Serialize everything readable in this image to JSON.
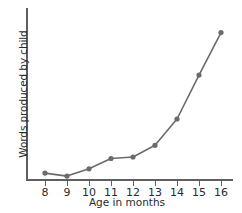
{
  "chart_data": {
    "type": "line",
    "title": "",
    "xlabel": "Age in months",
    "ylabel": "Words produced by child",
    "categories": [
      "8",
      "9",
      "10",
      "11",
      "12",
      "13",
      "14",
      "15",
      "16"
    ],
    "x": [
      8,
      9,
      10,
      11,
      12,
      13,
      14,
      15,
      16
    ],
    "values": [
      4,
      2,
      7,
      14,
      15,
      23,
      41,
      71,
      100
    ],
    "xlim": [
      8,
      16
    ],
    "ylim": [
      0,
      110
    ],
    "x_tick_labels": [
      "8",
      "9",
      "10",
      "11",
      "12",
      "13",
      "14",
      "15",
      "16"
    ],
    "y_tick_labels": [],
    "grid": false,
    "legend": false,
    "series": [
      {
        "name": "Words produced by child",
        "values": [
          4,
          2,
          7,
          14,
          15,
          23,
          41,
          71,
          100
        ],
        "color": "#6b6b6b",
        "marker": "circle"
      }
    ]
  },
  "colors": {
    "series": "#6b6b6b",
    "axis": "#5f5f5f",
    "text": "#2b2b2b",
    "background": "#ffffff"
  }
}
